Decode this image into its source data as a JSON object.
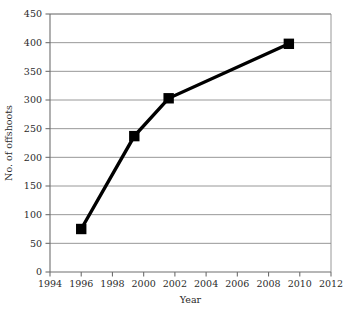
{
  "chart_data": {
    "type": "line",
    "title": "",
    "subtitle": "",
    "xlabel": "Year",
    "ylabel": "No. of offshoots",
    "xlim": [
      1994,
      2012
    ],
    "ylim": [
      0,
      450
    ],
    "xticks": [
      1994,
      1996,
      1998,
      2000,
      2002,
      2004,
      2006,
      2008,
      2010,
      2012
    ],
    "yticks": [
      0,
      50,
      100,
      150,
      200,
      250,
      300,
      350,
      400,
      450
    ],
    "xtick_labels": [
      "1994",
      "1996",
      "1998",
      "2000",
      "2002",
      "2004",
      "2006",
      "2008",
      "2010",
      "2012"
    ],
    "ytick_labels": [
      "0",
      "50",
      "100",
      "150",
      "200",
      "250",
      "300",
      "350",
      "400",
      "450"
    ],
    "grid": "horizontal",
    "legend": "none",
    "marker": "filled-square",
    "line_color": "#000000",
    "grid_color": "#8c8c8c",
    "frame_color": "#8c8c8c",
    "series": [
      {
        "name": "No. of offshoots",
        "x": [
          1996,
          1999.4,
          2001.6,
          2009.3
        ],
        "values": [
          75,
          237,
          303,
          398
        ],
        "points": [
          {
            "x": 1996,
            "y": 75
          },
          {
            "x": 1999.4,
            "y": 237
          },
          {
            "x": 2001.6,
            "y": 303
          },
          {
            "x": 2009.3,
            "y": 398
          }
        ]
      }
    ]
  }
}
